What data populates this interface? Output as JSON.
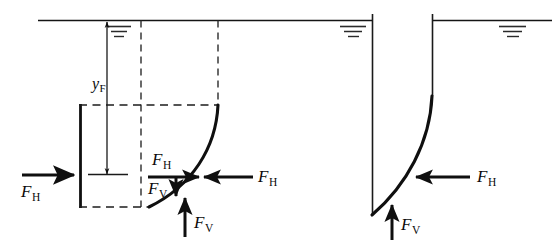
{
  "figure": {
    "type": "free-body-diagram",
    "panels": [
      {
        "id": "left-panel",
        "name": "fluid-column-free-body",
        "labels": {
          "depth_label": {
            "base": "y",
            "sub": "F",
            "text": "yF"
          },
          "left_force": {
            "base": "F",
            "sub": "H",
            "text": "FH"
          },
          "inner_horizontal_force": {
            "base": "F",
            "sub": "H",
            "text": "FH"
          },
          "inner_vertical_force": {
            "base": "F",
            "sub": "V",
            "text": "FV"
          },
          "right_force": {
            "base": "F",
            "sub": "H",
            "text": "FH"
          },
          "bottom_force": {
            "base": "F",
            "sub": "V",
            "text": "FV"
          }
        }
      },
      {
        "id": "right-panel",
        "name": "curved-surface-free-body",
        "labels": {
          "horizontal_force": {
            "base": "F",
            "sub": "H",
            "text": "FH"
          },
          "vertical_force": {
            "base": "F",
            "sub": "V",
            "text": "FV"
          }
        }
      }
    ],
    "colors": {
      "ink": "#0f0f0f",
      "line": "#141414",
      "background": "#ffffff"
    },
    "symbols": {
      "water_surface": "free-surface-line",
      "water_level_mark": "three-decreasing-horizontal-bars",
      "dashed_construction_line": "dashed",
      "solid_wall": "solid-thick"
    }
  }
}
